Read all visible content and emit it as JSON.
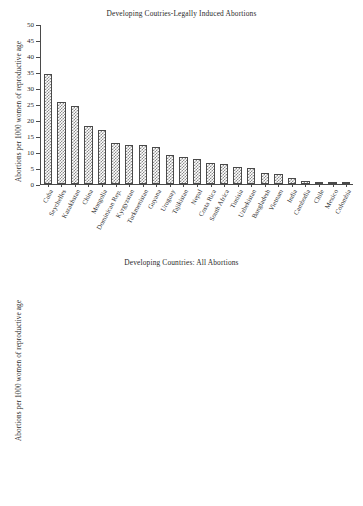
{
  "document": {
    "kind": "two-panel-bar-chart-figure",
    "background_color": "#ffffff",
    "text_color": "#2a2a2a"
  },
  "chart_data": [
    {
      "type": "bar",
      "panel": "top",
      "title": "Developing Coutries-Legally Induced Abortions",
      "xlabel": "",
      "ylabel": "Abortions per 1000 women of reproductive age",
      "ylim": [
        0,
        50
      ],
      "yticks": [
        0,
        5,
        10,
        15,
        20,
        25,
        30,
        35,
        40,
        45,
        50
      ],
      "ytick_labels": [
        "0",
        "5",
        "10",
        "15",
        "20",
        "25",
        "30",
        "35",
        "40",
        "45",
        "50"
      ],
      "grid": false,
      "legend": "none",
      "bar_style": "cross-hatch",
      "bar_fill_color": "#ffffff",
      "bar_hatch_color": "#8c8c8c",
      "bar_edge_color": "#4a4a4a",
      "categories": [
        "Cuba",
        "Seychelles",
        "Kazakhstan",
        "China",
        "Mongolia",
        "Dominican Rep.",
        "Kyrgyzstan",
        "Turkmenistan",
        "Guyana",
        "Uruguay",
        "Tajikistan",
        "Nepal",
        "Costa Rica",
        "South Africa",
        "Tunisia",
        "Uzbekistan",
        "Bangladesh",
        "Vietnam",
        "India",
        "Cambodia",
        "Chile",
        "Mexico",
        "Colombia"
      ],
      "values": [
        34.5,
        25.8,
        24.5,
        18.4,
        17.0,
        13.0,
        12.3,
        12.2,
        11.7,
        9.1,
        8.5,
        7.8,
        6.5,
        6.2,
        5.4,
        5.0,
        3.5,
        3.2,
        1.9,
        1.0,
        0.5,
        0.5,
        0.1
      ]
    },
    {
      "type": "bar",
      "panel": "bottom",
      "title": "Developing Countries: All Abortions",
      "xlabel": "",
      "ylabel": "Abortions per 1000 women of reproductive age",
      "ylim": [
        0,
        50
      ],
      "yticks": [
        0,
        5,
        10,
        15,
        20,
        25,
        30,
        35,
        40,
        45,
        50
      ],
      "ytick_labels": [
        "0",
        "5",
        "10",
        "15",
        "20",
        "25",
        "30",
        "35",
        "40",
        "45",
        "50"
      ],
      "grid": false,
      "legend": "none",
      "bar_style": "solid",
      "bar_fill_color": "#5e5e5e",
      "bar_edge_color": "#3a3a3a",
      "categories": [
        "Pakistan",
        "Kenya",
        "Uganda",
        "Colombia",
        "Mexico",
        "Tanzania",
        "Nigeria",
        "Bangladesh",
        "Ethiopia",
        "Ghana",
        "Burkina Faso",
        "Rwanda",
        "Senegal"
      ],
      "values": [
        50.0,
        48.0,
        39.0,
        39.0,
        38.0,
        36.0,
        33.0,
        29.0,
        28.0,
        28.0,
        25.0,
        25.0,
        17.0
      ]
    }
  ]
}
